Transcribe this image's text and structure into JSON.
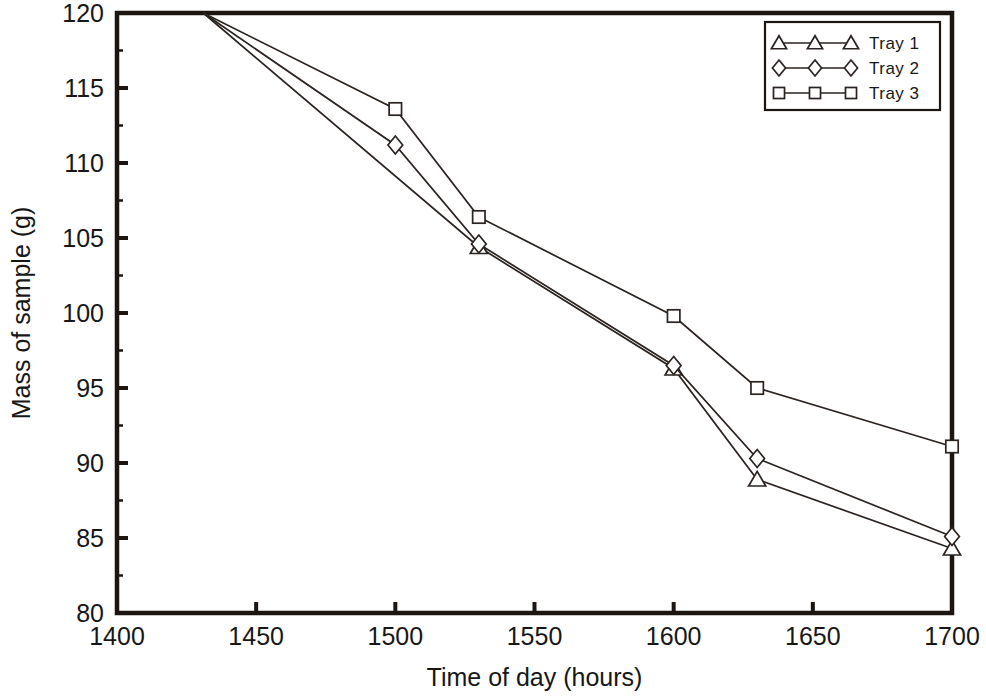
{
  "chart_data": {
    "type": "line",
    "title": "",
    "xlabel": "Time of day (hours)",
    "ylabel": "Mass of sample (g)",
    "xlim": [
      1400,
      1700
    ],
    "ylim": [
      80,
      120
    ],
    "xticks": [
      1400,
      1450,
      1500,
      1550,
      1600,
      1650,
      1700
    ],
    "xtick_labels": [
      "1400",
      "1450",
      "1500",
      "1550",
      "1600",
      "1650",
      "1700"
    ],
    "yticks": [
      80,
      85,
      90,
      95,
      100,
      105,
      110,
      115,
      120
    ],
    "ytick_labels": [
      "80",
      "85",
      "90",
      "95",
      "100",
      "105",
      "110",
      "115",
      "120"
    ],
    "grid": false,
    "legend_position": "top-right",
    "series": [
      {
        "name": "Tray 1",
        "marker": "triangle",
        "x": [
          1431,
          1530,
          1600,
          1630,
          1700
        ],
        "y": [
          120.0,
          104.4,
          96.3,
          88.9,
          84.3
        ]
      },
      {
        "name": "Tray 2",
        "marker": "diamond",
        "x": [
          1431,
          1500,
          1530,
          1600,
          1630,
          1700
        ],
        "y": [
          120.0,
          111.2,
          104.6,
          96.5,
          90.3,
          85.1
        ]
      },
      {
        "name": "Tray 3",
        "marker": "square",
        "x": [
          1431,
          1500,
          1530,
          1600,
          1630,
          1700
        ],
        "y": [
          120.0,
          113.6,
          106.4,
          99.8,
          95.0,
          91.1
        ]
      }
    ],
    "colors": {
      "line": "#2a2320",
      "marker_fill": "#ffffff",
      "axis": "#1c1512",
      "background": "#ffffff"
    }
  }
}
